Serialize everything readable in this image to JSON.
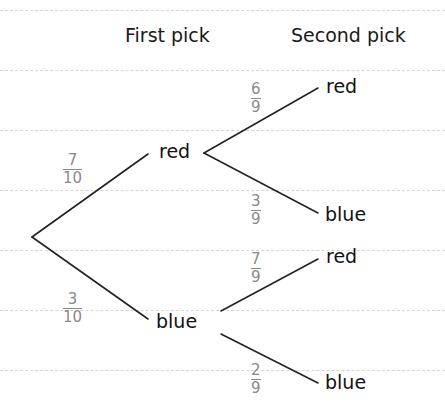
{
  "headers": {
    "first": "First pick",
    "second": "Second pick"
  },
  "root": {
    "x": 32,
    "y": 237
  },
  "first_pick": [
    {
      "label": "red",
      "probability": {
        "num": "7",
        "den": "10"
      }
    },
    {
      "label": "blue",
      "probability": {
        "num": "3",
        "den": "10"
      }
    }
  ],
  "second_pick": [
    {
      "parent": "red",
      "label": "red",
      "probability": {
        "num": "6",
        "den": "9"
      }
    },
    {
      "parent": "red",
      "label": "blue",
      "probability": {
        "num": "3",
        "den": "9"
      }
    },
    {
      "parent": "blue",
      "label": "red",
      "probability": {
        "num": "7",
        "den": "9"
      }
    },
    {
      "parent": "blue",
      "label": "blue",
      "probability": {
        "num": "2",
        "den": "9"
      }
    }
  ],
  "colors": {
    "line": "#222222",
    "fraction": "#8a8a8a",
    "text": "#111111",
    "ruled": "#d6d6d6"
  }
}
